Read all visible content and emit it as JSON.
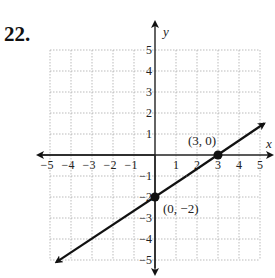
{
  "problem": {
    "number": "22."
  },
  "chart_data": {
    "type": "line",
    "title": "",
    "xlabel": "x",
    "ylabel": "y",
    "xlim": [
      -5,
      5
    ],
    "ylim": [
      -5,
      5
    ],
    "grid": true,
    "x_ticks": [
      "−5",
      "−4",
      "−3",
      "−2",
      "−1",
      "1",
      "2",
      "3",
      "4",
      "5"
    ],
    "y_ticks": [
      "5",
      "4",
      "3",
      "2",
      "1",
      "−1",
      "−2",
      "−3",
      "−4",
      "−5"
    ],
    "series": [
      {
        "name": "line",
        "equation": "y = (2/3)x - 2",
        "x": [
          -4.7,
          5.2
        ],
        "y": [
          -5.1,
          1.5
        ],
        "arrows": "both"
      }
    ],
    "points": [
      {
        "x": 3,
        "y": 0,
        "label": "(3, 0)"
      },
      {
        "x": 0,
        "y": -2,
        "label": "(0, −2)"
      }
    ],
    "colors": {
      "line": "#111111",
      "grid": "#aaaaaa",
      "axis": "#222222"
    }
  }
}
